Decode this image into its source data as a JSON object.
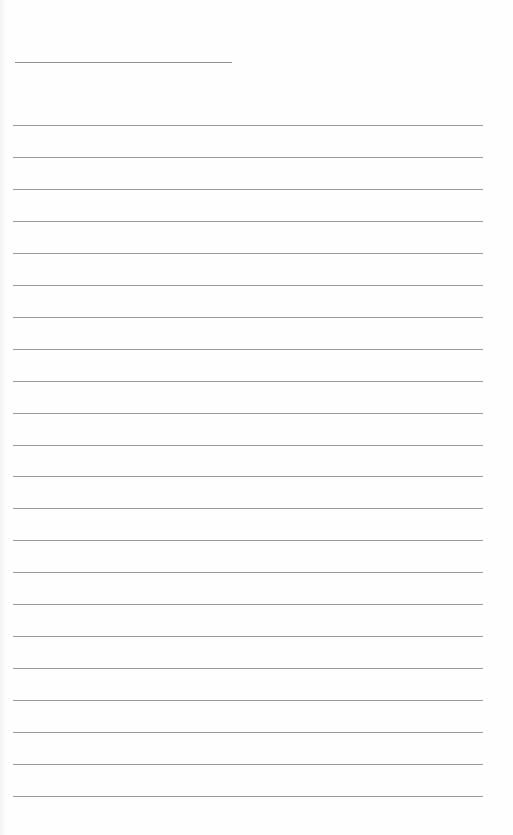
{
  "page": {
    "type": "lined-paper",
    "background_color": "#fefefe",
    "rule_color": "#9a9a9a",
    "header_line": {
      "left": 15,
      "top": 62,
      "width": 217
    },
    "rules": {
      "count": 22,
      "first_top": 125,
      "spacing": 31.95,
      "left": 13,
      "width": 470
    }
  }
}
